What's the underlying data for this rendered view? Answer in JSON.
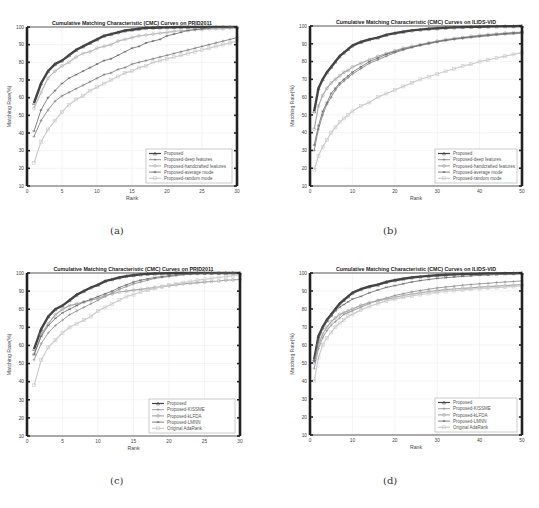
{
  "panels": [
    {
      "label": "(a)"
    },
    {
      "label": "(b)"
    },
    {
      "label": "(c)"
    },
    {
      "label": "(d)"
    }
  ],
  "chart_data": [
    {
      "type": "line",
      "title": "Cumulative Matching Characteristic (CMC) Curves on PRID2011",
      "xlabel": "Rank",
      "ylabel": "Matching Rate(%)",
      "xlim": [
        0,
        30
      ],
      "ylim": [
        10,
        100
      ],
      "xticks": [
        0,
        5,
        10,
        15,
        20,
        25,
        30
      ],
      "yticks": [
        10,
        20,
        30,
        40,
        50,
        60,
        70,
        80,
        90,
        100
      ],
      "grid": true,
      "legend_position": "lower right",
      "x": [
        1,
        2,
        3,
        4,
        5,
        6,
        7,
        8,
        9,
        10,
        11,
        12,
        13,
        14,
        15,
        16,
        17,
        18,
        19,
        20,
        21,
        22,
        23,
        24,
        25,
        26,
        27,
        28,
        29,
        30
      ],
      "series": [
        {
          "name": "Proposed",
          "color": "#444444",
          "width": 2.4,
          "marker": "triangle",
          "values": [
            57,
            68,
            75,
            79,
            81,
            84,
            87,
            89,
            91,
            93,
            95,
            96,
            97,
            98,
            98.5,
            99,
            99.5,
            99.6,
            99.7,
            99.8,
            99.9,
            100,
            100,
            100,
            100,
            100,
            100,
            100,
            100,
            100
          ]
        },
        {
          "name": "Proposed-deep features",
          "color": "#777777",
          "width": 0.8,
          "marker": "plus",
          "values": [
            38,
            47,
            53,
            58,
            61,
            63,
            65,
            67,
            69,
            71,
            73,
            74,
            76,
            77,
            79,
            80,
            81,
            82,
            83,
            84,
            85,
            86,
            87,
            88,
            89,
            90,
            91,
            92,
            93,
            94
          ]
        },
        {
          "name": "Proposed-handcrafted features",
          "color": "#bbbbbb",
          "width": 1.2,
          "marker": "circle",
          "values": [
            54,
            63,
            71,
            75,
            78,
            80,
            83,
            85,
            86,
            88,
            89,
            90,
            92,
            93,
            94,
            95,
            95.5,
            96,
            96.5,
            97,
            97.5,
            98,
            98,
            98.5,
            98.5,
            99,
            99,
            99,
            99.5,
            99.5
          ]
        },
        {
          "name": "Proposed-average mode",
          "color": "#666666",
          "width": 0.8,
          "marker": "asterisk",
          "values": [
            41,
            53,
            60,
            64,
            68,
            71,
            73,
            75,
            77,
            79,
            81,
            82,
            84,
            86,
            88,
            89,
            91,
            92,
            93,
            95,
            96,
            97,
            98,
            98.5,
            99,
            99.5,
            99.7,
            99.8,
            99.9,
            100
          ]
        },
        {
          "name": "Proposed-random mode",
          "color": "#cccccc",
          "width": 1.2,
          "marker": "square",
          "values": [
            23,
            35,
            42,
            47,
            52,
            56,
            59,
            61,
            64,
            66,
            68,
            70,
            72,
            74,
            75,
            77,
            78,
            80,
            81,
            82,
            83,
            84,
            85,
            86,
            87,
            88,
            89,
            90,
            91,
            92
          ]
        }
      ]
    },
    {
      "type": "line",
      "title": "Cumulative Matching Characteristic (CMC) Curves on ILIDS-VID",
      "xlabel": "Rank",
      "ylabel": "Matching Rate(%)",
      "xlim": [
        0,
        50
      ],
      "ylim": [
        10,
        100
      ],
      "xticks": [
        0,
        10,
        20,
        30,
        40,
        50
      ],
      "yticks": [
        10,
        20,
        30,
        40,
        50,
        60,
        70,
        80,
        90,
        100
      ],
      "grid": true,
      "legend_position": "lower right",
      "x": [
        1,
        2,
        3,
        4,
        5,
        6,
        7,
        8,
        9,
        10,
        12,
        14,
        16,
        18,
        20,
        22,
        24,
        26,
        28,
        30,
        32,
        34,
        36,
        38,
        40,
        42,
        44,
        46,
        48,
        50
      ],
      "series": [
        {
          "name": "Proposed",
          "color": "#444444",
          "width": 2.4,
          "marker": "triangle",
          "values": [
            52,
            65,
            70,
            74,
            77,
            80,
            83,
            85,
            87,
            89,
            91,
            92.5,
            93.5,
            95,
            96,
            96.8,
            97.5,
            98,
            98.4,
            98.7,
            99,
            99.2,
            99.4,
            99.5,
            99.6,
            99.7,
            99.8,
            99.9,
            99.9,
            100
          ]
        },
        {
          "name": "Proposed-deep features",
          "color": "#777777",
          "width": 0.8,
          "marker": "plus",
          "values": [
            30,
            42,
            50,
            56,
            60,
            64,
            67,
            69,
            71,
            73,
            76,
            79,
            81,
            83,
            85,
            86.5,
            88,
            89,
            90,
            91,
            91.8,
            92.5,
            93,
            93.5,
            94,
            94.5,
            95,
            95.3,
            95.6,
            96
          ]
        },
        {
          "name": "Proposed-handcrafted features",
          "color": "#aaaaaa",
          "width": 1.2,
          "marker": "circle",
          "values": [
            42,
            55,
            61,
            65,
            68,
            70,
            72,
            74,
            75,
            77,
            79,
            81,
            83,
            84.5,
            86,
            87.5,
            88.5,
            89.5,
            90.5,
            91.5,
            92.3,
            93,
            93.6,
            94.2,
            94.7,
            95.2,
            95.6,
            96,
            96.3,
            96.6
          ]
        },
        {
          "name": "Proposed-average mode",
          "color": "#666666",
          "width": 0.8,
          "marker": "asterisk",
          "values": [
            33,
            44,
            52,
            57,
            62,
            65,
            68,
            70,
            72,
            74,
            77,
            80,
            82,
            84,
            85.5,
            87,
            88,
            89.3,
            90.3,
            91.2,
            92,
            92.7,
            93.3,
            93.9,
            94.4,
            94.9,
            95.3,
            95.7,
            96,
            96.3
          ]
        },
        {
          "name": "Proposed-random mode",
          "color": "#cccccc",
          "width": 1.2,
          "marker": "square",
          "values": [
            19,
            27,
            32,
            36,
            40,
            43,
            46,
            48,
            50,
            52,
            55,
            57,
            60,
            62,
            64,
            66,
            68,
            70,
            71.5,
            73,
            74.5,
            76,
            77.5,
            78.5,
            80,
            81,
            82,
            83,
            84,
            85
          ]
        }
      ]
    },
    {
      "type": "line",
      "title": "Cumulative Matching Characteristic (CMC) Curves on PRID2011",
      "xlabel": "Rank",
      "ylabel": "Matching Rate(%)",
      "xlim": [
        0,
        30
      ],
      "ylim": [
        10,
        100
      ],
      "xticks": [
        0,
        5,
        10,
        15,
        20,
        25,
        30
      ],
      "yticks": [
        10,
        20,
        30,
        40,
        50,
        60,
        70,
        80,
        90,
        100
      ],
      "grid": true,
      "legend_position": "lower right",
      "x": [
        1,
        2,
        3,
        4,
        5,
        6,
        7,
        8,
        9,
        10,
        11,
        12,
        13,
        14,
        15,
        16,
        17,
        18,
        19,
        20,
        21,
        22,
        23,
        24,
        25,
        26,
        27,
        28,
        29,
        30
      ],
      "series": [
        {
          "name": "Proposed",
          "color": "#444444",
          "width": 2.4,
          "marker": "triangle",
          "values": [
            58,
            69,
            76,
            80,
            82,
            85,
            88,
            90,
            92,
            93.5,
            95.5,
            96.5,
            97.5,
            98.3,
            98.8,
            99.2,
            99.5,
            99.7,
            99.8,
            99.9,
            100,
            100,
            100,
            100,
            100,
            100,
            100,
            100,
            100,
            100
          ]
        },
        {
          "name": "Proposed-KISSME",
          "color": "#888888",
          "width": 0.8,
          "marker": "plus",
          "values": [
            52,
            61,
            67,
            71,
            74,
            77,
            79,
            81,
            83,
            85,
            87,
            89,
            91,
            92.5,
            94,
            95,
            96,
            97,
            97.5,
            98,
            98.5,
            99,
            99.3,
            99.5,
            99.7,
            99.8,
            99.9,
            100,
            100,
            100
          ]
        },
        {
          "name": "Proposed-kLFDA",
          "color": "#aaaaaa",
          "width": 1.2,
          "marker": "circle",
          "values": [
            55,
            66,
            72,
            77,
            80,
            82,
            83,
            84,
            85,
            86,
            87.5,
            88.5,
            89.5,
            90,
            90.5,
            91,
            91.5,
            92,
            92.5,
            93,
            93.5,
            94,
            94.3,
            94.7,
            95,
            95.3,
            95.6,
            96,
            96.2,
            96.5
          ]
        },
        {
          "name": "Proposed-LMNN",
          "color": "#666666",
          "width": 0.8,
          "marker": "asterisk",
          "values": [
            55,
            65,
            71,
            75,
            78,
            80,
            82,
            84,
            85.5,
            87,
            88.5,
            90,
            92,
            93.5,
            95,
            96,
            96.8,
            97.5,
            98,
            98.5,
            99,
            99.3,
            99.5,
            99.7,
            99.8,
            99.9,
            100,
            100,
            100,
            100
          ]
        },
        {
          "name": "Original AdaRank",
          "color": "#cccccc",
          "width": 1.2,
          "marker": "square",
          "values": [
            38,
            52,
            59,
            63,
            67,
            70,
            72,
            74,
            76,
            79,
            81,
            83,
            85,
            87,
            88,
            89.5,
            90.5,
            91.5,
            92.5,
            93.3,
            94,
            94.7,
            95.3,
            96,
            96.5,
            97,
            97.5,
            98,
            98.5,
            99
          ]
        }
      ]
    },
    {
      "type": "line",
      "title": "Cumulative Matching Characteristic (CMC) Curves on ILIDS-VID",
      "xlabel": "Rank",
      "ylabel": "Matching Rate(%)",
      "xlim": [
        0,
        50
      ],
      "ylim": [
        10,
        100
      ],
      "xticks": [
        0,
        10,
        20,
        30,
        40,
        50
      ],
      "yticks": [
        10,
        20,
        30,
        40,
        50,
        60,
        70,
        80,
        90,
        100
      ],
      "grid": true,
      "legend_position": "lower right",
      "x": [
        1,
        2,
        3,
        4,
        5,
        6,
        7,
        8,
        9,
        10,
        12,
        14,
        16,
        18,
        20,
        22,
        24,
        26,
        28,
        30,
        32,
        34,
        36,
        38,
        40,
        42,
        44,
        46,
        48,
        50
      ],
      "series": [
        {
          "name": "Proposed",
          "color": "#444444",
          "width": 2.4,
          "marker": "triangle",
          "values": [
            52,
            65,
            70,
            74,
            77,
            80,
            83,
            85,
            87,
            89,
            91,
            92.5,
            93.5,
            95,
            96,
            96.8,
            97.5,
            98,
            98.4,
            98.7,
            99,
            99.2,
            99.4,
            99.5,
            99.6,
            99.7,
            99.8,
            99.9,
            99.9,
            100
          ]
        },
        {
          "name": "Proposed-KISSME",
          "color": "#888888",
          "width": 0.8,
          "marker": "plus",
          "values": [
            47,
            58,
            64,
            68,
            71,
            73,
            75,
            77,
            78,
            79,
            81,
            83,
            85,
            86,
            87.5,
            88.5,
            89.5,
            90.3,
            91,
            91.7,
            92.2,
            92.7,
            93.2,
            93.6,
            94,
            94.3,
            94.7,
            95,
            95.3,
            95.6
          ]
        },
        {
          "name": "Proposed-kLFDA",
          "color": "#aaaaaa",
          "width": 1.2,
          "marker": "circle",
          "values": [
            50,
            60,
            66,
            70,
            73,
            75,
            77,
            78,
            79,
            80,
            82,
            83.5,
            84.5,
            85.5,
            86.5,
            87.5,
            88.3,
            89,
            89.7,
            90.2,
            90.7,
            91.1,
            91.5,
            91.8,
            92.1,
            92.4,
            92.7,
            93,
            93.2,
            93.5
          ]
        },
        {
          "name": "Proposed-LMNN",
          "color": "#666666",
          "width": 0.8,
          "marker": "asterisk",
          "values": [
            51,
            63,
            69,
            73,
            76,
            79,
            81,
            82.5,
            84,
            85.5,
            87,
            89,
            90.5,
            92,
            93,
            94,
            95,
            95.8,
            96.4,
            97,
            97.4,
            97.8,
            98.1,
            98.4,
            98.7,
            98.9,
            99.1,
            99.3,
            99.5,
            99.7
          ]
        },
        {
          "name": "Original AdaRank",
          "color": "#cccccc",
          "width": 1.2,
          "marker": "square",
          "values": [
            40,
            53,
            60,
            64,
            67,
            70,
            72,
            74,
            76,
            77,
            79.5,
            81.5,
            83,
            84.5,
            85.5,
            86.5,
            87.3,
            88,
            88.6,
            89.2,
            89.7,
            90.2,
            90.6,
            91,
            91.3,
            91.6,
            91.9,
            92.2,
            92.5,
            92.8
          ]
        }
      ]
    }
  ]
}
